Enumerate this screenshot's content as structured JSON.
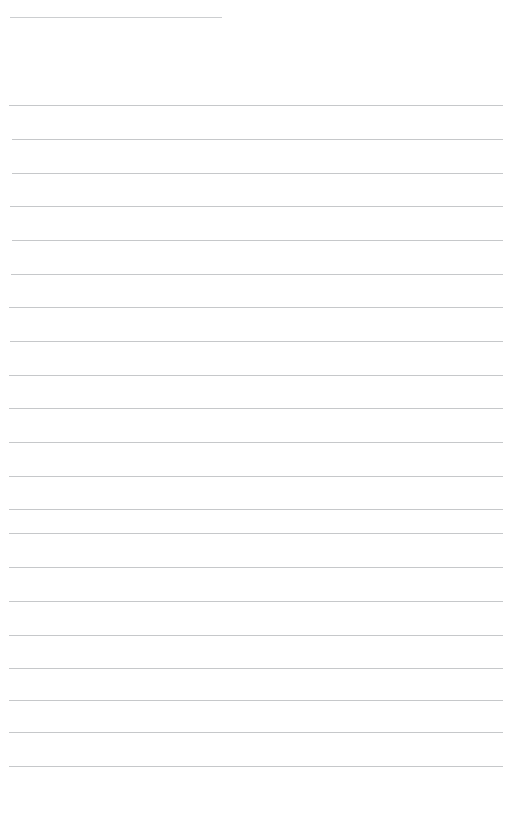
{
  "document": {
    "kind": "ruled-notebook-page",
    "background_color": "#ffffff",
    "rule_color": "#c6c8ca",
    "top_rule_color": "#c9cbcd",
    "page_width": 531,
    "page_height": 818
  },
  "top_rule": {
    "name": "top-divider",
    "x": 10,
    "y": 17,
    "width": 212,
    "height": 1
  },
  "header": {
    "y": 53,
    "fragments": [
      {
        "text": "",
        "x": 12
      },
      {
        "text": "",
        "x": 68
      },
      {
        "text": "",
        "x": 145
      },
      {
        "text": "",
        "x": 168
      }
    ]
  },
  "body": {
    "line_start_x": 9,
    "line_end_x": 503,
    "line_count": 20,
    "lines": [
      {
        "index": 1,
        "y": 105,
        "x": 9,
        "width": 494
      },
      {
        "index": 2,
        "y": 139,
        "x": 12,
        "width": 491
      },
      {
        "index": 3,
        "y": 173,
        "x": 12,
        "width": 491
      },
      {
        "index": 4,
        "y": 206,
        "x": 10,
        "width": 493
      },
      {
        "index": 5,
        "y": 240,
        "x": 12,
        "width": 491
      },
      {
        "index": 6,
        "y": 274,
        "x": 11,
        "width": 492
      },
      {
        "index": 7,
        "y": 307,
        "x": 9,
        "width": 494
      },
      {
        "index": 8,
        "y": 341,
        "x": 10,
        "width": 493
      },
      {
        "index": 9,
        "y": 375,
        "x": 9,
        "width": 494
      },
      {
        "index": 10,
        "y": 408,
        "x": 9,
        "width": 494
      },
      {
        "index": 11,
        "y": 442,
        "x": 9,
        "width": 494
      },
      {
        "index": 12,
        "y": 476,
        "x": 9,
        "width": 494
      },
      {
        "index": 13,
        "y": 509,
        "x": 9,
        "width": 494
      },
      {
        "index": 14,
        "y": 533,
        "x": 9,
        "width": 494
      },
      {
        "index": 15,
        "y": 567,
        "x": 9,
        "width": 494
      },
      {
        "index": 16,
        "y": 601,
        "x": 9,
        "width": 494
      },
      {
        "index": 17,
        "y": 635,
        "x": 9,
        "width": 494
      },
      {
        "index": 18,
        "y": 668,
        "x": 9,
        "width": 494
      },
      {
        "index": 19,
        "y": 700,
        "x": 9,
        "width": 494
      },
      {
        "index": 20,
        "y": 732,
        "x": 9,
        "width": 494
      },
      {
        "index": 21,
        "y": 766,
        "x": 9,
        "width": 494
      }
    ]
  }
}
